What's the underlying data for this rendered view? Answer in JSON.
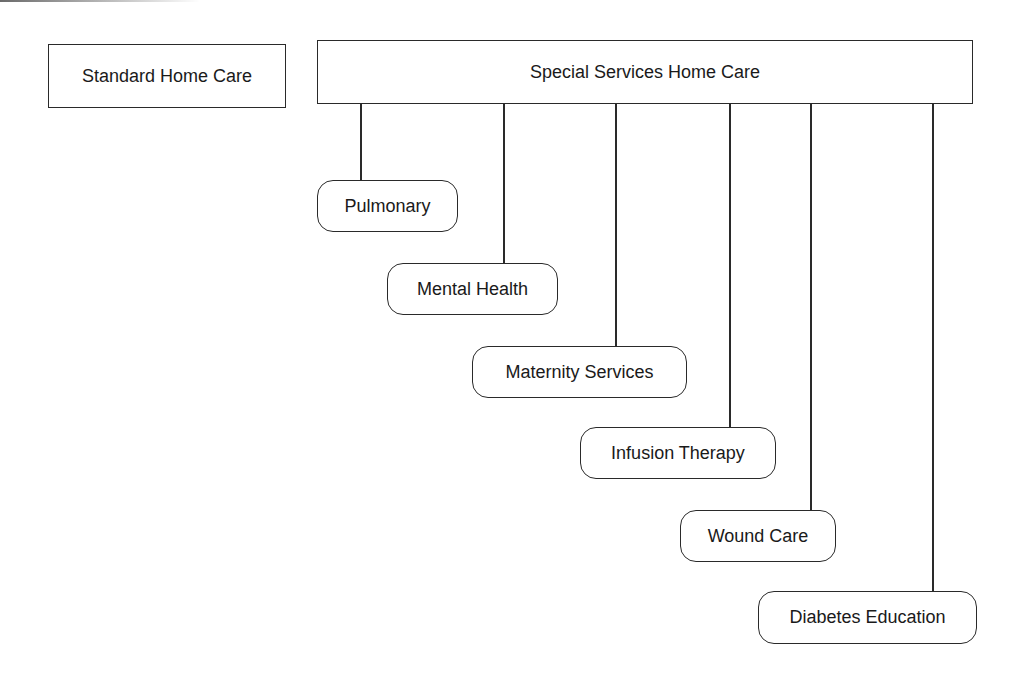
{
  "diagram": {
    "standalone": {
      "label": "Standard Home Care"
    },
    "parent": {
      "label": "Special Services Home Care"
    },
    "children": [
      {
        "label": "Pulmonary"
      },
      {
        "label": "Mental Health"
      },
      {
        "label": "Maternity Services"
      },
      {
        "label": "Infusion Therapy"
      },
      {
        "label": "Wound Care"
      },
      {
        "label": "Diabetes Education"
      }
    ]
  }
}
